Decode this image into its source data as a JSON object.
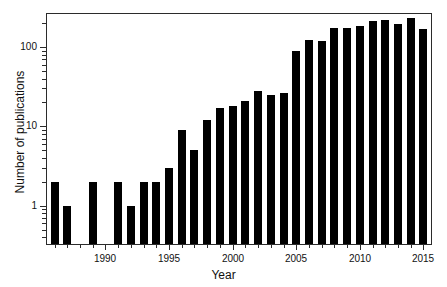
{
  "chart_data": {
    "type": "bar",
    "title": "",
    "subtitle": "",
    "xlabel": "Year",
    "ylabel": "Number of publications",
    "yscale": "log",
    "ylim": [
      0.33,
      260
    ],
    "xlim": [
      1985.4,
      2015.6
    ],
    "grid": false,
    "legend": null,
    "bar_color": "#000000",
    "categories": [
      "1986",
      "1987",
      "1988",
      "1989",
      "1990",
      "1991",
      "1992",
      "1993",
      "1994",
      "1995",
      "1996",
      "1997",
      "1998",
      "1999",
      "2000",
      "2001",
      "2002",
      "2003",
      "2004",
      "2005",
      "2006",
      "2007",
      "2008",
      "2009",
      "2010",
      "2011",
      "2012",
      "2013",
      "2014",
      "2015"
    ],
    "values": [
      2,
      1,
      0,
      2,
      0,
      2,
      1,
      2,
      2,
      3,
      9,
      5,
      12,
      17,
      18,
      21,
      28,
      25,
      26,
      89,
      124,
      118,
      175,
      175,
      185,
      215,
      220,
      195,
      230,
      170
    ],
    "x_tick_labels": [
      "1990",
      "1995",
      "2000",
      "2005",
      "2010",
      "2015"
    ],
    "x_tick_values": [
      1990,
      1995,
      2000,
      2005,
      2010,
      2015
    ],
    "y_tick_labels": [
      "1",
      "10",
      "100"
    ],
    "y_tick_values": [
      1,
      10,
      100
    ]
  }
}
